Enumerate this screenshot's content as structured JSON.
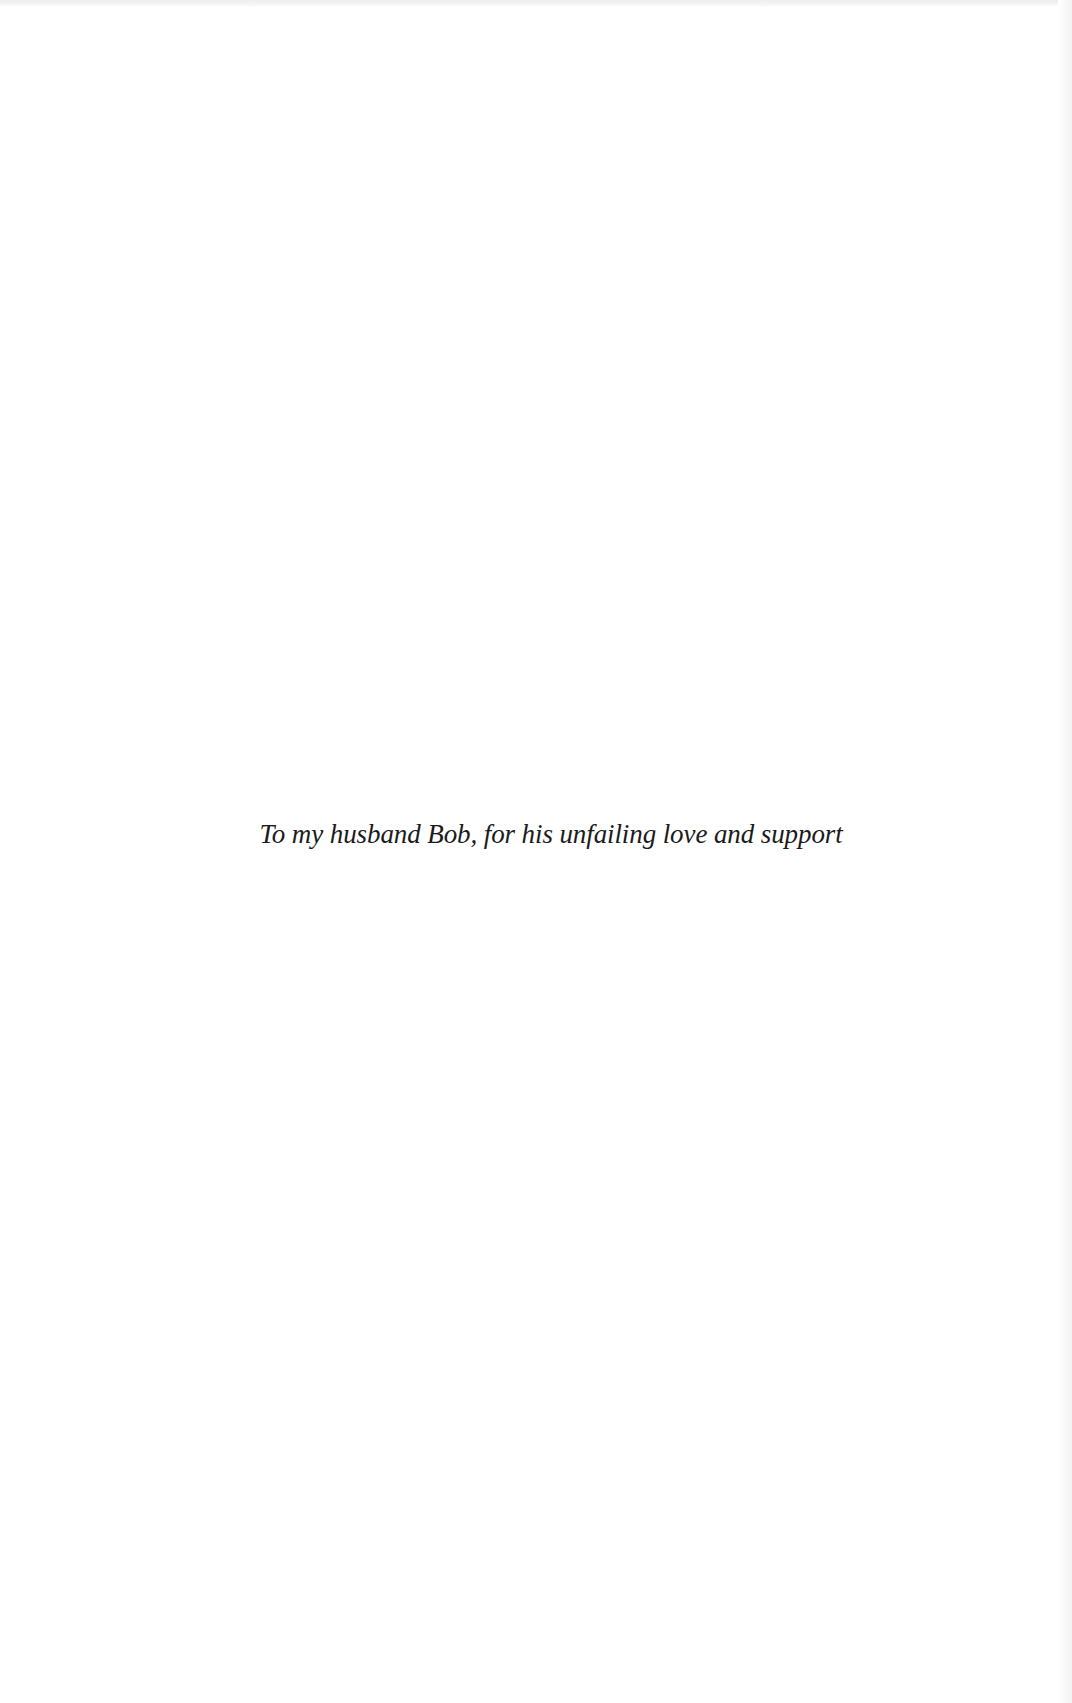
{
  "page": {
    "type": "dedication",
    "background_color": "#ffffff",
    "text_color": "#1b1b1b"
  },
  "dedication": {
    "text": "To my husband Bob, for his unfailing love and support"
  }
}
